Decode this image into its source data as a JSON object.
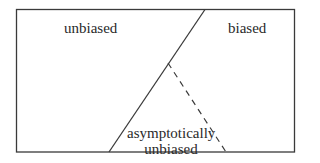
{
  "diagram": {
    "regions": [
      {
        "id": "unbiased",
        "label": "unbiased"
      },
      {
        "id": "biased",
        "label": "biased"
      },
      {
        "id": "asymptotically-unbiased",
        "label_line1": "asymptotically",
        "label_line2": "unbiased"
      }
    ],
    "lines": {
      "box": {
        "x1": 16,
        "y1": 9,
        "x2": 295,
        "y2": 152,
        "style": "solid"
      },
      "divider": {
        "from": [
          205,
          9
        ],
        "to": [
          109,
          152
        ],
        "style": "solid"
      },
      "dashed": {
        "from": [
          168,
          63
        ],
        "to": [
          226,
          152
        ],
        "style": "dashed"
      }
    },
    "colors": {
      "stroke": "#3a3a3a",
      "text": "#2a2a2a",
      "background": "#ffffff"
    }
  }
}
